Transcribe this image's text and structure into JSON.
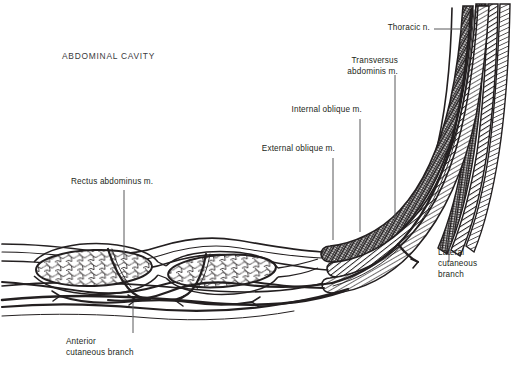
{
  "figure": {
    "background_color": "#ffffff",
    "ink_color": "#231f20",
    "leader_color": "#58585b"
  },
  "labels": {
    "abdominal_cavity": "ABDOMINAL CAVITY",
    "rectus_abdominus": "Rectus abdominus m.",
    "external_oblique": "External oblique m.",
    "internal_oblique": "Internal oblique m.",
    "transversus_abdominis_line1": "Transversus",
    "transversus_abdominis_line2": "abdominis m.",
    "thoracic_nerve": "Thoracic n.",
    "lateral_cutaneous_line1": "Lateral",
    "lateral_cutaneous_line2": "cutaneous",
    "lateral_cutaneous_line3": "branch",
    "anterior_cutaneous_line1": "Anterior",
    "anterior_cutaneous_line2": "cutaneous branch"
  },
  "structures": {
    "rectus_bellies": 2,
    "muscle_layers": [
      {
        "name": "transversus-abdominis",
        "pattern": "crosshatch"
      },
      {
        "name": "internal-oblique",
        "pattern": "diagonal-hatch"
      },
      {
        "name": "external-oblique",
        "pattern": "fine-hatch"
      }
    ],
    "nerve_branches": [
      "thoracic-nerve-trunk",
      "lateral-cutaneous-branch",
      "anterior-cutaneous-branch"
    ]
  }
}
